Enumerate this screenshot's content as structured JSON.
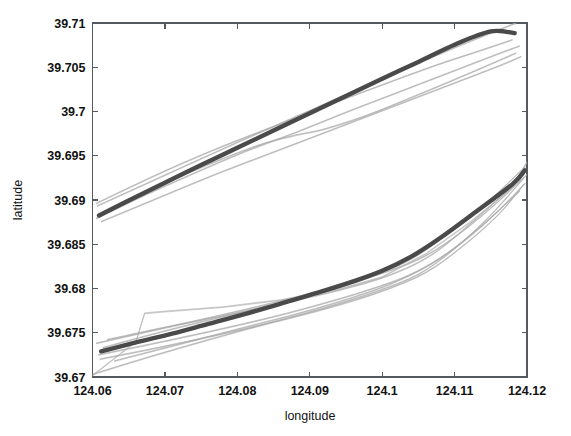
{
  "chart_data": {
    "type": "line",
    "title": "",
    "xlabel": "longitude",
    "ylabel": "latitude",
    "xlim": [
      124.06,
      124.12
    ],
    "ylim": [
      39.67,
      39.71
    ],
    "xticks": [
      "124.06",
      "124.07",
      "124.08",
      "124.09",
      "124.1",
      "124.11",
      "124.12"
    ],
    "xtick_values": [
      124.06,
      124.07,
      124.08,
      124.09,
      124.1,
      124.11,
      124.12
    ],
    "yticks": [
      "39.67",
      "39.675",
      "39.68",
      "39.685",
      "39.69",
      "39.695",
      "39.7",
      "39.705",
      "39.71"
    ],
    "ytick_values": [
      39.67,
      39.675,
      39.68,
      39.685,
      39.69,
      39.695,
      39.7,
      39.705,
      39.71
    ],
    "grid": false,
    "legend": "none",
    "colors": {
      "mean_track": "#4a4a4a",
      "individual_track": "#9a9a9a",
      "axis": "#555a5e",
      "background": "#ffffff"
    },
    "clusters": [
      {
        "name": "upper-cluster",
        "mean_track": {
          "name": "upper-mean",
          "x": [
            124.0609,
            124.065,
            124.07,
            124.075,
            124.08,
            124.085,
            124.09,
            124.095,
            124.1,
            124.105,
            124.11,
            124.115,
            124.1183
          ],
          "y": [
            39.68825,
            39.68995,
            39.69195,
            39.69395,
            39.6959,
            39.69785,
            39.6998,
            39.70175,
            39.7037,
            39.7056,
            39.70755,
            39.70905,
            39.70885
          ]
        },
        "tracks": [
          {
            "name": "upper-track-1",
            "x": [
              124.0605,
              124.066,
              124.072,
              124.079,
              124.086,
              124.093,
              124.1,
              124.107,
              124.114,
              124.118
            ],
            "y": [
              39.6896,
              39.69175,
              39.694,
              39.6964,
              39.6986,
              39.70085,
              39.703,
              39.7051,
              39.707,
              39.7081
            ]
          },
          {
            "name": "upper-track-2",
            "x": [
              124.0605,
              124.067,
              124.074,
              124.081,
              124.088,
              124.095,
              124.102,
              124.109,
              124.116,
              124.119
            ],
            "y": [
              39.6879,
              39.69045,
              39.693,
              39.69545,
              39.6976,
              39.6999,
              39.7021,
              39.7043,
              39.7065,
              39.7074
            ]
          },
          {
            "name": "upper-track-3",
            "x": [
              124.0608,
              124.068,
              124.076,
              124.083,
              124.088,
              124.092,
              124.098,
              124.105,
              124.112,
              124.1185
            ],
            "y": [
              39.68835,
              39.6912,
              39.694,
              39.6962,
              39.6973,
              39.698,
              39.6996,
              39.7019,
              39.7043,
              39.7066
            ]
          },
          {
            "name": "upper-track-4",
            "x": [
              124.0612,
              124.069,
              124.077,
              124.085,
              124.093,
              124.101,
              124.109,
              124.116,
              124.1192
            ],
            "y": [
              39.68755,
              39.6902,
              39.6929,
              39.6954,
              39.6979,
              39.7004,
              39.7029,
              39.7051,
              39.7062
            ]
          },
          {
            "name": "upper-track-5",
            "x": [
              124.0606,
              124.07,
              124.08,
              124.09,
              124.1,
              124.11,
              124.1185
            ],
            "y": [
              39.6893,
              39.6928,
              39.6965,
              39.7001,
              39.7037,
              39.7072,
              39.71
            ]
          }
        ]
      },
      {
        "name": "lower-cluster",
        "mean_track": {
          "name": "lower-mean",
          "x": [
            124.0612,
            124.066,
            124.071,
            124.076,
            124.081,
            124.086,
            124.091,
            124.096,
            124.1,
            124.104,
            124.108,
            124.113,
            124.118,
            124.1197
          ],
          "y": [
            39.6729,
            39.6739,
            39.6749,
            39.676,
            39.6771,
            39.6783,
            39.6795,
            39.6808,
            39.682,
            39.6836,
            39.6857,
            39.6887,
            39.6918,
            39.69335
          ]
        },
        "tracks": [
          {
            "name": "lower-track-1",
            "x": [
              124.0605,
              124.067,
              124.074,
              124.081,
              124.088,
              124.095,
              124.101,
              124.106,
              124.111,
              124.116,
              124.1196
            ],
            "y": [
              39.6738,
              39.675,
              39.6763,
              39.6776,
              39.679,
              39.6805,
              39.682,
              39.6837,
              39.6864,
              39.6898,
              39.6926
            ]
          },
          {
            "name": "lower-track-2",
            "x": [
              124.0608,
              124.068,
              124.076,
              124.084,
              124.091,
              124.098,
              124.104,
              124.109,
              124.114,
              124.119
            ],
            "y": [
              39.6725,
              39.6737,
              39.6751,
              39.6766,
              39.6781,
              39.6798,
              39.6816,
              39.684,
              39.6873,
              39.691
            ]
          },
          {
            "name": "lower-track-3",
            "x": [
              124.0614,
              124.07,
              124.079,
              124.087,
              124.094,
              124.1,
              124.105,
              124.11,
              124.115,
              124.1198
            ],
            "y": [
              39.6733,
              39.6752,
              39.677,
              39.6786,
              39.6801,
              39.6818,
              39.6838,
              39.6868,
              39.6901,
              39.6938
            ]
          },
          {
            "name": "lower-track-4",
            "x": [
              124.061,
              124.069,
              124.077,
              124.085,
              124.093,
              124.1,
              124.106,
              124.111,
              124.116,
              124.1196
            ],
            "y": [
              39.672,
              39.6733,
              39.6747,
              39.6762,
              39.6779,
              39.6797,
              39.6818,
              39.6847,
              39.6883,
              39.6918
            ]
          },
          {
            "name": "lower-track-5-outlier",
            "x": [
              124.06,
              124.066,
              124.0672,
              124.07,
              124.078,
              124.086,
              124.094,
              124.1,
              124.106,
              124.112,
              124.118,
              124.12
            ],
            "y": [
              39.67015,
              39.674,
              39.6772,
              39.6774,
              39.6779,
              39.6787,
              39.6799,
              39.6813,
              39.6839,
              39.6874,
              39.6914,
              39.6943
            ]
          },
          {
            "name": "lower-track-6",
            "x": [
              124.06,
              124.068,
              124.076,
              124.084,
              124.092,
              124.099,
              124.105,
              124.11,
              124.115,
              124.12
            ],
            "y": [
              39.6703,
              39.6723,
              39.6742,
              39.676,
              39.6778,
              39.6796,
              39.6816,
              39.6845,
              39.6883,
              39.6929
            ]
          },
          {
            "name": "lower-track-7",
            "x": [
              124.062,
              124.07,
              124.078,
              124.086,
              124.094,
              124.101,
              124.107,
              124.113,
              124.119
            ],
            "y": [
              39.6742,
              39.6756,
              39.6769,
              39.6783,
              39.6798,
              39.6815,
              39.6839,
              39.6879,
              39.6923
            ]
          },
          {
            "name": "lower-track-8",
            "x": [
              124.063,
              124.072,
              124.081,
              124.089,
              124.096,
              124.102,
              124.108,
              124.114,
              124.1198
            ],
            "y": [
              39.6718,
              39.6737,
              39.6756,
              39.6773,
              39.679,
              39.6808,
              39.6834,
              39.6872,
              39.6919
            ]
          }
        ]
      }
    ]
  }
}
